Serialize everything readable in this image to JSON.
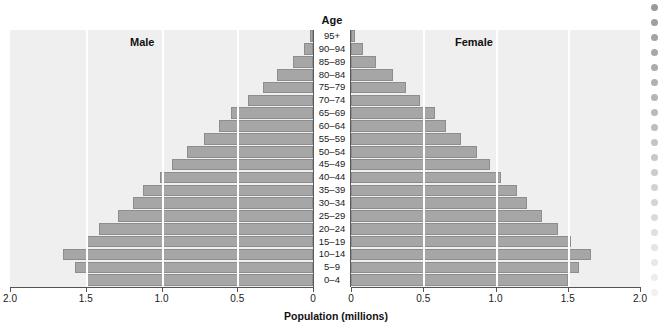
{
  "chart_data": {
    "type": "bar",
    "subtype": "population-pyramid",
    "title": "",
    "xlabel": "Population (millions)",
    "ylabel": "Age",
    "grid": true,
    "legend_position": "inside-top",
    "axis_title": "Age",
    "left_series_label": "Male",
    "right_series_label": "Female",
    "xlim_left": [
      2.0,
      0
    ],
    "xlim_right": [
      0,
      2.0
    ],
    "xticks_left": [
      "2.0",
      "1.5",
      "1.0",
      "0.5",
      "0"
    ],
    "xticks_right": [
      "0",
      "0.5",
      "1.0",
      "1.5",
      "2.0"
    ],
    "xtick_values_left": [
      2.0,
      1.5,
      1.0,
      0.5,
      0
    ],
    "xtick_values_right": [
      0,
      0.5,
      1.0,
      1.5,
      2.0
    ],
    "categories": [
      "95+",
      "90–94",
      "85–89",
      "80–84",
      "75–79",
      "70–74",
      "65–69",
      "60–64",
      "55–59",
      "50–54",
      "45–49",
      "40–44",
      "35–39",
      "30–34",
      "25–29",
      "20–24",
      "15–19",
      "10–14",
      "5–9",
      "0–4"
    ],
    "series": [
      {
        "name": "Male",
        "values": [
          0.02,
          0.06,
          0.13,
          0.24,
          0.33,
          0.43,
          0.54,
          0.62,
          0.72,
          0.83,
          0.93,
          1.01,
          1.12,
          1.19,
          1.29,
          1.41,
          1.5,
          1.65,
          1.57,
          1.49
        ]
      },
      {
        "name": "Female",
        "values": [
          0.03,
          0.08,
          0.17,
          0.29,
          0.38,
          0.48,
          0.58,
          0.66,
          0.76,
          0.87,
          0.96,
          1.04,
          1.15,
          1.22,
          1.32,
          1.43,
          1.52,
          1.66,
          1.58,
          1.5
        ]
      }
    ],
    "bar_color": "#a6a6a6",
    "bar_border_color": "#8d8d8d",
    "plot_background": "#efefef",
    "gridline_color": "#ffffff",
    "axis_color": "#555555"
  },
  "decoration": {
    "dot_color": "#9a9a9a",
    "dot_count": 20
  }
}
